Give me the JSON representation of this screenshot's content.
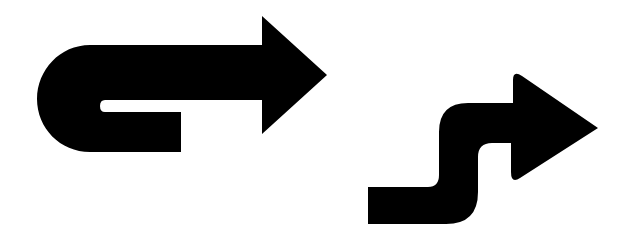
{
  "figure": {
    "background_color": "#ffffff",
    "fill_color": "#000000",
    "items": [
      {
        "icon": "u-turn-right-arrow-icon",
        "label": "U-turn arrow pointing right"
      },
      {
        "icon": "s-curve-right-arrow-icon",
        "label": "S-curve arrow pointing right"
      }
    ]
  }
}
